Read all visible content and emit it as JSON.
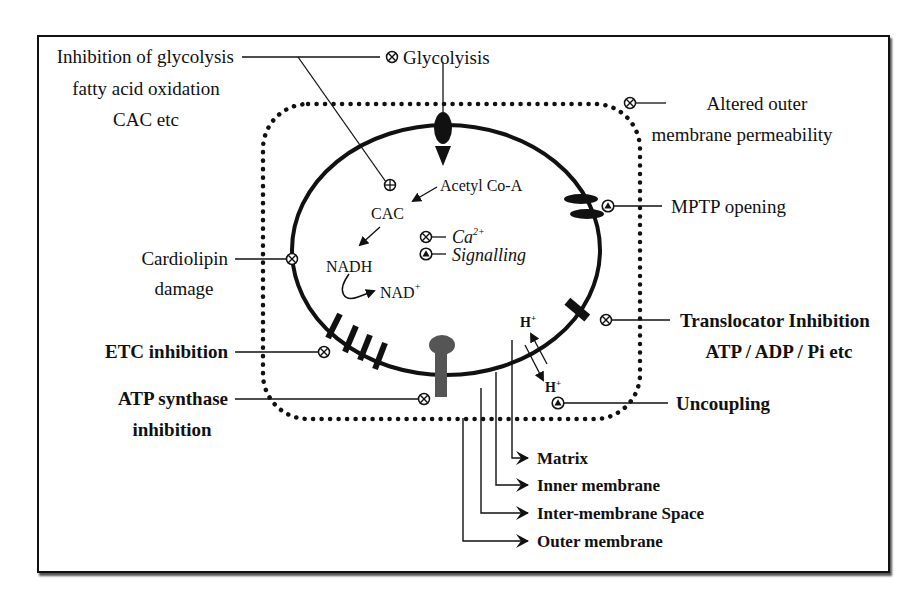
{
  "colors": {
    "ink": "#111111",
    "atp_synthase": "#555555",
    "background": "#ffffff"
  },
  "legend_symbols": {
    "inhibition": "circle-cross (⊗)",
    "activation": "circle-triangle (▲ in circle)",
    "cac_inhibition": "circle-plus (⊕)"
  },
  "labels": {
    "inhibition_glycolysis": [
      "Inhibition of glycolysis",
      "fatty acid oxidation",
      "CAC etc"
    ],
    "glycolysis": "Glycolyisis",
    "altered_outer": [
      "Altered outer",
      "membrane permeability"
    ],
    "mptp": "MPTP opening",
    "translocator": [
      "Translocator Inhibition",
      "ATP / ADP / Pi etc"
    ],
    "uncoupling": "Uncoupling",
    "cardiolipin": [
      "Cardiolipin",
      "damage"
    ],
    "etc": "ETC inhibition",
    "atp_synthase": [
      "ATP synthase",
      "inhibition"
    ],
    "acetyl_coa": "Acetyl Co-A",
    "cac": "CAC",
    "nadh": "NADH",
    "nad": "NAD",
    "nad_sup": "+",
    "ca": "Ca",
    "ca_sup": "2+",
    "signalling": "Signalling",
    "h_plus_top": "H",
    "h_plus_bottom": "H",
    "h_sup": "+"
  },
  "compartments": [
    {
      "label": "Matrix"
    },
    {
      "label": "Inner membrane"
    },
    {
      "label": "Inter-membrane Space"
    },
    {
      "label": "Outer membrane"
    }
  ]
}
